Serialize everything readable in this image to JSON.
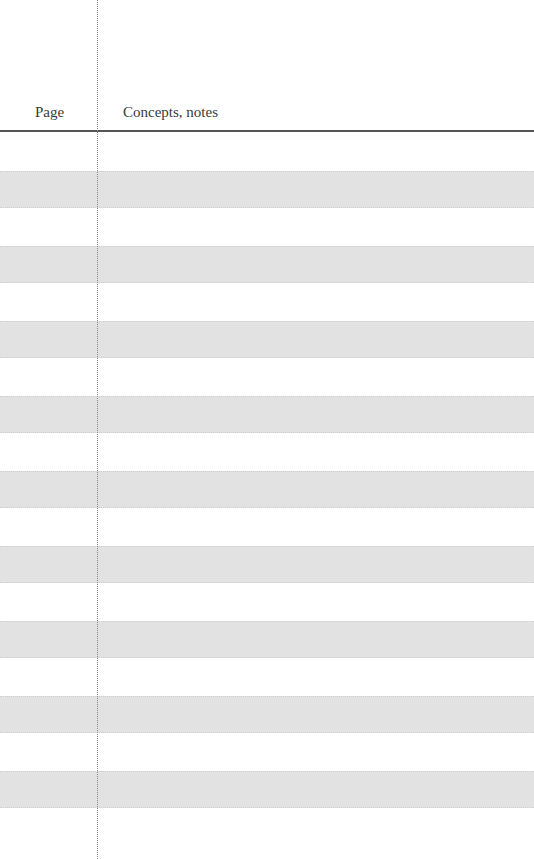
{
  "header": {
    "page_label": "Page",
    "notes_label": "Concepts, notes"
  },
  "layout": {
    "stripe_count": 9,
    "stripe_top_first": 171,
    "stripe_step": 75,
    "stripe_color": "#e2e2e2"
  }
}
